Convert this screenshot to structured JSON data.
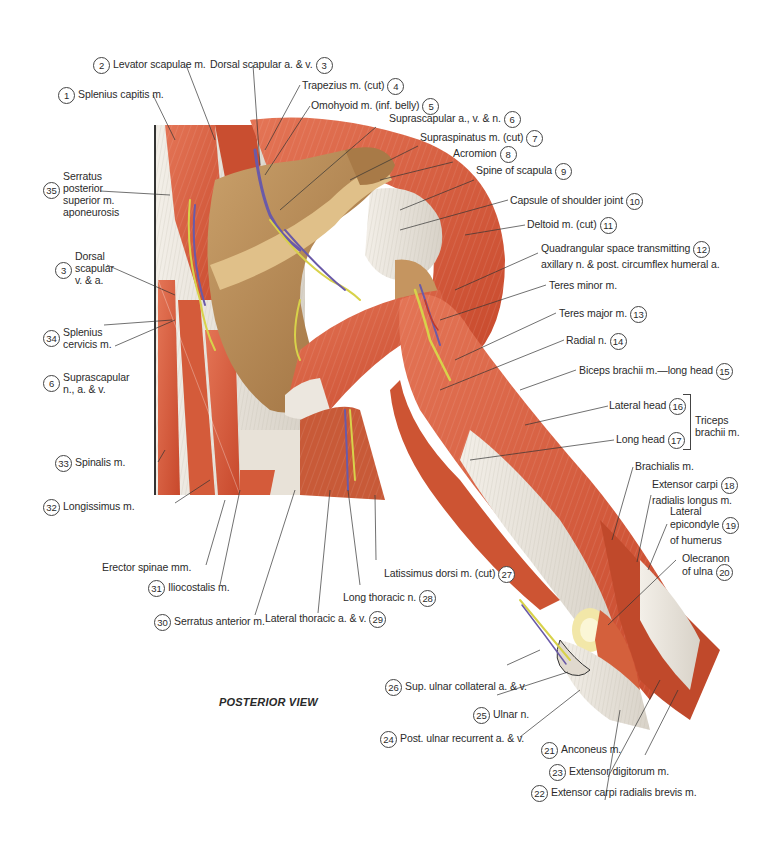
{
  "figure": {
    "view_title": "POSTERIOR VIEW",
    "colors": {
      "muscle": "#d9603f",
      "muscle_dark": "#b8432a",
      "tendon": "#e8e4dc",
      "bone": "#b98a55",
      "nerve": "#d8d24a",
      "vein": "#6a5aa8",
      "artery": "#c0392b"
    }
  },
  "labels": [
    {
      "id": "1",
      "text": "Splenius capitis m."
    },
    {
      "id": "2",
      "text": "Levator scapulae m."
    },
    {
      "id": "3",
      "text": "Dorsal scapular a. & v."
    },
    {
      "id": "4",
      "text": "Trapezius m. (cut)"
    },
    {
      "id": "5",
      "text": "Omohyoid m. (inf. belly)"
    },
    {
      "id": "6",
      "text": "Suprascapular a., v. & n."
    },
    {
      "id": "7",
      "text": "Supraspinatus m. (cut)"
    },
    {
      "id": "8",
      "text": "Acromion"
    },
    {
      "id": "9",
      "text": "Spine of scapula"
    },
    {
      "id": "10",
      "text": "Capsule of shoulder joint"
    },
    {
      "id": "11",
      "text": "Deltoid m. (cut)"
    },
    {
      "id": "12",
      "text": "Quadrangular space transmitting",
      "text2": "axillary n. & post. circumflex humeral a."
    },
    {
      "id": "",
      "text": "Teres minor m."
    },
    {
      "id": "13",
      "text": "Teres major m."
    },
    {
      "id": "14",
      "text": "Radial n."
    },
    {
      "id": "15",
      "text": "Biceps brachii m.—long head"
    },
    {
      "id": "16",
      "text": "Lateral head"
    },
    {
      "id": "17",
      "text": "Long head"
    },
    {
      "id": "",
      "text": "Brachialis m."
    },
    {
      "id": "18",
      "text": "Extensor carpi",
      "text2": "radialis longus m."
    },
    {
      "id": "19",
      "text": "Lateral",
      "text2": "epicondyle",
      "text3": "of humerus"
    },
    {
      "id": "20",
      "text": "Olecranon",
      "text2": "of ulna"
    },
    {
      "id": "21",
      "text": "Anconeus m."
    },
    {
      "id": "23",
      "text": "Extensor digitorum m."
    },
    {
      "id": "22",
      "text": "Extensor carpi radialis brevis m."
    },
    {
      "id": "24",
      "text": "Post. ulnar recurrent a. & v."
    },
    {
      "id": "25",
      "text": "Ulnar n."
    },
    {
      "id": "26",
      "text": "Sup. ulnar collateral a. & v."
    },
    {
      "id": "27",
      "text": "Latissimus dorsi m. (cut)"
    },
    {
      "id": "28",
      "text": "Long thoracic n."
    },
    {
      "id": "29",
      "text": "Lateral thoracic a. & v."
    },
    {
      "id": "30",
      "text": "Serratus anterior m."
    },
    {
      "id": "31",
      "text": "Iliocostalis m."
    },
    {
      "id": "",
      "text": "Erector spinae mm."
    },
    {
      "id": "32",
      "text": "Longissimus m."
    },
    {
      "id": "33",
      "text": "Spinalis m."
    },
    {
      "id": "6",
      "text": "Suprascapular",
      "text2": "n., a. & v."
    },
    {
      "id": "34",
      "text": "Splenius",
      "text2": "cervicis m."
    },
    {
      "id": "3",
      "text": "Dorsal",
      "text2": "scapular",
      "text3": "v. & a."
    },
    {
      "id": "35",
      "text": "Serratus",
      "text2": "posterior",
      "text3": "superior m.",
      "text4": "aponeurosis"
    }
  ],
  "group_labels": {
    "triceps": {
      "text": "Triceps",
      "text2": "brachii m."
    }
  }
}
